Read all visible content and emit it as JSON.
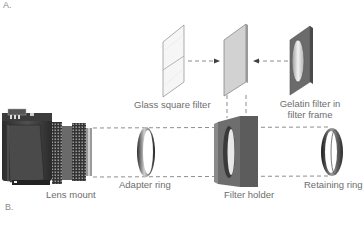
{
  "diagram": {
    "panel_labels": [
      "A.",
      "B."
    ],
    "components": {
      "glass_square_filter": "Glass square filter",
      "gelatin_filter_line1": "Gelatin filter in",
      "gelatin_filter_line2": "filter frame",
      "lens_mount": "Lens mount",
      "adapter_ring": "Adapter ring",
      "filter_holder": "Filter holder",
      "retaining_ring": "Retaining ring"
    },
    "colors": {
      "text": "#6d6d6d",
      "camera_body": "#3a3a3a",
      "dashed_line": "#707070",
      "filter_frame": "#6b6b6b",
      "glass_filter": "#f4f4f4"
    }
  }
}
